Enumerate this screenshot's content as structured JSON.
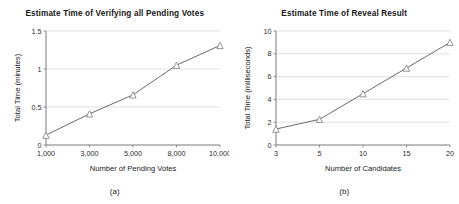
{
  "figure": {
    "panels": [
      {
        "caption": "(a)",
        "chart_data": {
          "type": "line",
          "title": "Estimate Time of Verifying all Pending Votes",
          "xlabel": "Number of Pending Votes",
          "ylabel": "Total Time (minutes)",
          "categories": [
            "1,000",
            "3,000",
            "5,000",
            "8,000",
            "10,000"
          ],
          "values": [
            0.13,
            0.41,
            0.66,
            1.05,
            1.31
          ],
          "ylim": [
            0,
            1.5
          ],
          "yticks": [
            "0",
            "0.5",
            "1",
            "1.5"
          ],
          "ytick_values": [
            0,
            0.5,
            1,
            1.5
          ],
          "grid": "horizontal",
          "legend": "none",
          "marker": "triangle",
          "line_color": "#6b6b6b",
          "marker_color": "#8a8a8a"
        }
      },
      {
        "caption": "(b)",
        "chart_data": {
          "type": "line",
          "title": "Estimate Time of Reveal Result",
          "xlabel": "Number of Candidates",
          "ylabel": "Total Time (milliseconds)",
          "categories": [
            "3",
            "5",
            "10",
            "15",
            "20"
          ],
          "values": [
            1.4,
            2.25,
            4.5,
            6.75,
            9.0
          ],
          "ylim": [
            0,
            10
          ],
          "yticks": [
            "0",
            "2",
            "4",
            "6",
            "8",
            "10"
          ],
          "ytick_values": [
            0,
            2,
            4,
            6,
            8,
            10
          ],
          "grid": "horizontal",
          "legend": "none",
          "marker": "triangle",
          "line_color": "#6b6b6b",
          "marker_color": "#8a8a8a"
        }
      }
    ]
  }
}
